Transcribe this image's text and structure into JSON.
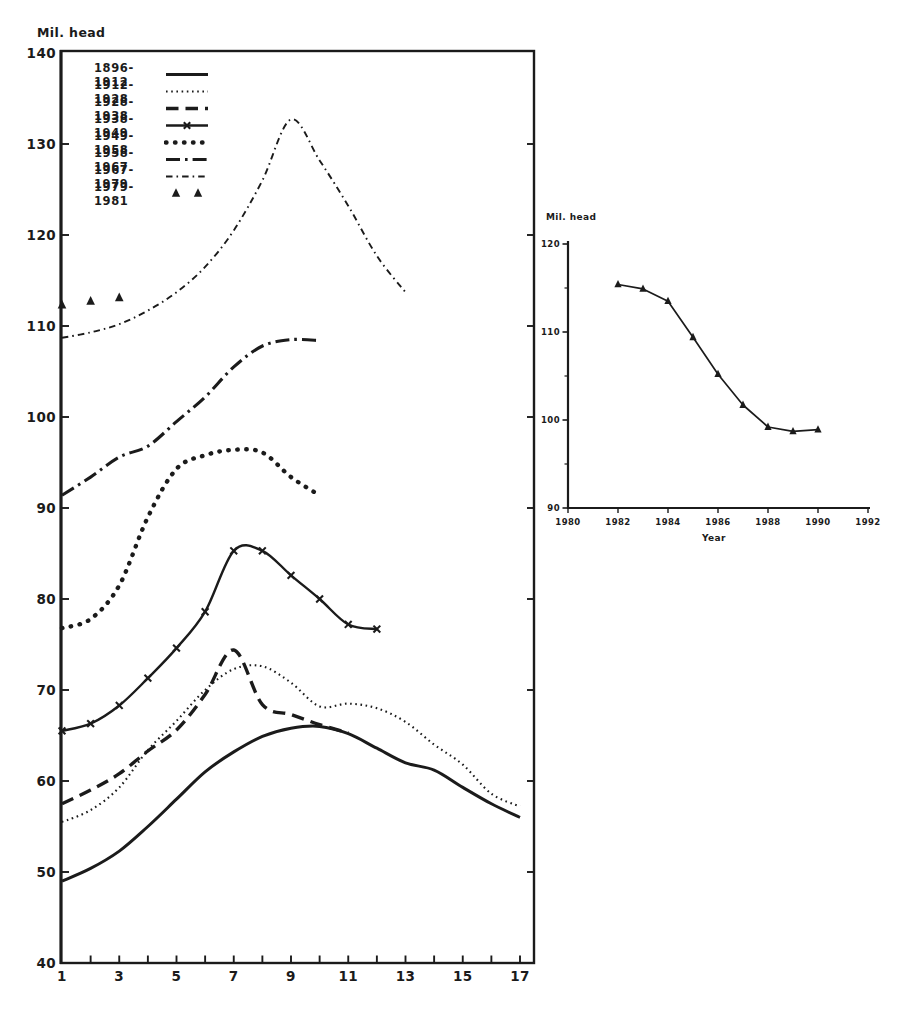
{
  "figure": {
    "ink": "#1b1b1b",
    "background": "#ffffff"
  },
  "chart_data": [
    {
      "id": "main",
      "type": "line",
      "title": "",
      "ylabel": "Mil. head",
      "xlabel": "",
      "xlim": [
        1,
        17
      ],
      "ylim": [
        40,
        140
      ],
      "x_tick_labels": [
        1,
        3,
        5,
        7,
        9,
        11,
        13,
        15,
        17
      ],
      "y_tick_labels": [
        40,
        50,
        60,
        70,
        80,
        90,
        100,
        110,
        120,
        130,
        140
      ],
      "grid": false,
      "legend_position": "top-left",
      "series": [
        {
          "name": "1896-1912",
          "style": "solid",
          "x": [
            1,
            2,
            3,
            4,
            5,
            6,
            7,
            8,
            9,
            10,
            11,
            12,
            13,
            14,
            15,
            16,
            17
          ],
          "values": [
            49,
            50.4,
            52.3,
            55,
            58,
            61,
            63.2,
            64.9,
            65.8,
            66,
            65.2,
            63.6,
            62,
            61.2,
            59.3,
            57.5,
            56
          ]
        },
        {
          "name": "1912-1928",
          "style": "dotted-fine",
          "x": [
            1,
            2,
            3,
            4,
            5,
            6,
            7,
            8,
            9,
            10,
            11,
            12,
            13,
            14,
            15,
            16,
            17
          ],
          "values": [
            55.5,
            56.8,
            59.3,
            63.4,
            66.6,
            70,
            72.3,
            72.6,
            70.8,
            68.2,
            68.5,
            68,
            66.5,
            64,
            61.8,
            58.6,
            57.2
          ]
        },
        {
          "name": "1928-1938",
          "style": "dashed",
          "x": [
            1,
            2,
            3,
            4,
            5,
            6,
            7,
            8,
            9,
            10,
            11
          ],
          "values": [
            57.5,
            59,
            60.8,
            63.3,
            65.6,
            69.5,
            74.4,
            68.4,
            67.3,
            66.2,
            65.3
          ]
        },
        {
          "name": "1938-1949",
          "style": "solid-x",
          "x": [
            1,
            2,
            3,
            4,
            5,
            6,
            7,
            8,
            9,
            10,
            11,
            12
          ],
          "values": [
            65.5,
            66.3,
            68.3,
            71.3,
            74.6,
            78.6,
            85.3,
            85.3,
            82.6,
            80,
            77.2,
            76.7
          ]
        },
        {
          "name": "1949-1958",
          "style": "dots-bold",
          "x": [
            1,
            2,
            3,
            4,
            5,
            6,
            7,
            8,
            9,
            10
          ],
          "values": [
            76.8,
            77.8,
            81.5,
            89,
            94.3,
            95.8,
            96.4,
            96.1,
            93.4,
            91.4
          ]
        },
        {
          "name": "1958-1967",
          "style": "dashdot-heavy",
          "x": [
            1,
            2,
            3,
            4,
            5,
            6,
            7,
            8,
            9,
            10
          ],
          "values": [
            91.4,
            93.4,
            95.6,
            96.8,
            99.5,
            102.2,
            105.5,
            107.8,
            108.5,
            108.4
          ]
        },
        {
          "name": "1967-1979",
          "style": "dashdot-fine",
          "x": [
            1,
            2,
            3,
            4,
            5,
            6,
            7,
            8,
            9,
            10,
            11,
            12,
            13
          ],
          "values": [
            108.7,
            109.3,
            110.2,
            111.7,
            113.7,
            116.5,
            120.5,
            126,
            132.7,
            128.2,
            123.2,
            117.7,
            113.7
          ]
        },
        {
          "name": "1979-1981",
          "style": "triangles",
          "x": [
            1,
            2,
            3
          ],
          "values": [
            112.3,
            112.7,
            113.1
          ]
        }
      ]
    },
    {
      "id": "inset",
      "type": "line",
      "title": "",
      "ylabel": "Mil. head",
      "xlabel": "Year",
      "xlim": [
        1980,
        1992
      ],
      "ylim": [
        90,
        120
      ],
      "x_tick_labels": [
        1980,
        1982,
        1984,
        1986,
        1988,
        1990,
        1992
      ],
      "y_tick_labels": [
        90,
        100,
        110,
        120
      ],
      "y_minor_ticks": [
        95,
        105,
        115
      ],
      "grid": false,
      "series": [
        {
          "name": "1982-1990",
          "style": "solid-triangles",
          "x": [
            1982,
            1983,
            1984,
            1985,
            1986,
            1987,
            1988,
            1989,
            1990
          ],
          "values": [
            115.4,
            114.9,
            113.5,
            109.4,
            105.2,
            101.7,
            99.2,
            98.7,
            98.9
          ]
        }
      ]
    }
  ]
}
